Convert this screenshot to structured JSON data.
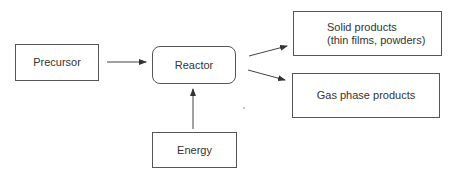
{
  "diagram": {
    "nodes": {
      "precursor": {
        "label": "Precursor"
      },
      "reactor": {
        "label": "Reactor"
      },
      "energy": {
        "label": "Energy"
      },
      "solid_products": {
        "line1": "Solid products",
        "line2": "(thin films, powders)"
      },
      "gas_products": {
        "label": "Gas phase products"
      }
    },
    "edges": [
      {
        "from": "Precursor",
        "to": "Reactor"
      },
      {
        "from": "Energy",
        "to": "Reactor"
      },
      {
        "from": "Reactor",
        "to": "Solid products"
      },
      {
        "from": "Reactor",
        "to": "Gas phase products"
      }
    ]
  }
}
